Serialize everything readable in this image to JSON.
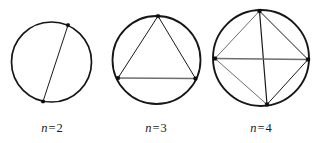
{
  "figure": {
    "background_color": "#ffffff",
    "stroke_color": "#161616",
    "accent_gray": "#6e6e6e",
    "width": 317,
    "height": 143,
    "panels": [
      {
        "id": "panel-n2",
        "caption_variable": "n",
        "caption_equals": "=",
        "caption_value": "2",
        "caption_full": "n = 2",
        "caption_x": 34,
        "caption_y": 122,
        "caption_width": 36,
        "circle": {
          "cx": 51.5,
          "cy": 62.0,
          "r": 40.0,
          "stroke_width": 1.7
        },
        "vertices": [
          {
            "name": "vertex-top-right",
            "x": 68.0,
            "y": 25.2
          },
          {
            "name": "vertex-bottom-left",
            "x": 43.0,
            "y": 101.5
          }
        ],
        "chords": [
          {
            "name": "chord-0-1",
            "from": 0,
            "to": 1,
            "shade": "dark",
            "width": 1.0
          }
        ],
        "vertex_size": 3.2,
        "chord_count": 1,
        "region_count": 2
      },
      {
        "id": "panel-n3",
        "caption_variable": "n",
        "caption_equals": "=",
        "caption_value": "3",
        "caption_full": "n = 3",
        "caption_x": 138,
        "caption_y": 122,
        "caption_width": 36,
        "circle": {
          "cx": 156.5,
          "cy": 60.0,
          "r": 44.0,
          "stroke_width": 1.8
        },
        "vertices": [
          {
            "name": "vertex-apex",
            "x": 158.0,
            "y": 16.1
          },
          {
            "name": "vertex-bottom-left",
            "x": 118.0,
            "y": 78.0
          },
          {
            "name": "vertex-bottom-right",
            "x": 195.5,
            "y": 78.5
          }
        ],
        "chords": [
          {
            "name": "chord-apex-left",
            "from": 0,
            "to": 1,
            "shade": "dark",
            "width": 1.0
          },
          {
            "name": "chord-apex-right",
            "from": 0,
            "to": 2,
            "shade": "dark",
            "width": 1.0
          },
          {
            "name": "chord-left-right",
            "from": 1,
            "to": 2,
            "shade": "gray",
            "width": 1.5
          }
        ],
        "vertex_size": 3.4,
        "chord_count": 3,
        "region_count": 4
      },
      {
        "id": "panel-n4",
        "caption_variable": "n",
        "caption_equals": "=",
        "caption_value": "4",
        "caption_full": "n = 4",
        "caption_x": 243,
        "caption_y": 122,
        "caption_width": 36,
        "circle": {
          "cx": 261.0,
          "cy": 58.0,
          "r": 48.0,
          "stroke_width": 1.9
        },
        "vertices": [
          {
            "name": "vertex-top",
            "x": 259.5,
            "y": 11.0
          },
          {
            "name": "vertex-left",
            "x": 215.0,
            "y": 58.5
          },
          {
            "name": "vertex-right",
            "x": 308.0,
            "y": 59.5
          },
          {
            "name": "vertex-bottom",
            "x": 267.0,
            "y": 104.5
          }
        ],
        "chords": [
          {
            "name": "chord-top-left",
            "from": 0,
            "to": 1,
            "shade": "gray",
            "width": 1.0
          },
          {
            "name": "chord-top-right",
            "from": 0,
            "to": 2,
            "shade": "dark",
            "width": 1.0
          },
          {
            "name": "chord-top-bottom",
            "from": 0,
            "to": 3,
            "shade": "dark",
            "width": 1.2
          },
          {
            "name": "chord-left-right",
            "from": 1,
            "to": 2,
            "shade": "gray",
            "width": 1.5
          },
          {
            "name": "chord-left-bottom",
            "from": 1,
            "to": 3,
            "shade": "gray",
            "width": 1.0
          },
          {
            "name": "chord-right-bottom",
            "from": 2,
            "to": 3,
            "shade": "dark",
            "width": 1.0
          }
        ],
        "vertex_size": 3.6,
        "chord_count": 6,
        "region_count": 8
      }
    ]
  }
}
